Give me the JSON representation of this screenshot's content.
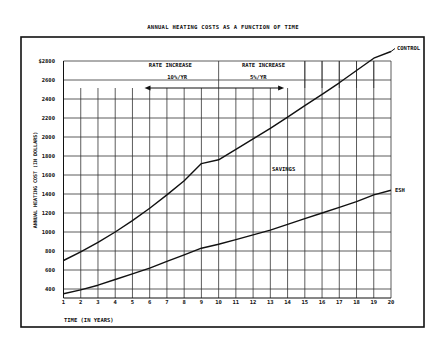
{
  "chart_data": {
    "type": "line",
    "title": "ANNUAL HEATING COSTS AS A FUNCTION OF TIME",
    "xlabel": "TIME (IN YEARS)",
    "ylabel": "ANNUAL HEATING COST (IN DOLLARS)",
    "x": [
      1,
      2,
      3,
      4,
      5,
      6,
      7,
      8,
      9,
      10,
      11,
      12,
      13,
      14,
      15,
      16,
      17,
      18,
      19,
      20
    ],
    "xlim": [
      1,
      20
    ],
    "ylim": [
      300,
      2800
    ],
    "x_ticks": [
      "1",
      "2",
      "3",
      "4",
      "5",
      "6",
      "7",
      "8",
      "9",
      "10",
      "11",
      "12",
      "13",
      "14",
      "15",
      "16",
      "17",
      "18",
      "19",
      "20"
    ],
    "y_ticks": [
      "$2800",
      "2600",
      "2400",
      "2200",
      "2000",
      "1800",
      "1600",
      "1400",
      "1200",
      "1000",
      "800",
      "600",
      "400"
    ],
    "grid": true,
    "series": [
      {
        "name": "CONTROL",
        "values": [
          700,
          790,
          890,
          1000,
          1120,
          1250,
          1390,
          1540,
          1720,
          1760,
          1870,
          1980,
          2090,
          2210,
          2330,
          2450,
          2570,
          2700,
          2830,
          2900
        ]
      },
      {
        "name": "ESH",
        "values": [
          350,
          390,
          440,
          500,
          560,
          620,
          690,
          760,
          830,
          870,
          920,
          970,
          1020,
          1080,
          1140,
          1200,
          1260,
          1320,
          1390,
          1440
        ]
      }
    ],
    "annotations": [
      {
        "text": "RATE INCREASE",
        "sub": "10%/YR",
        "range": [
          1,
          10
        ],
        "arrow": "left"
      },
      {
        "text": "RATE INCREASE",
        "sub": "5%/YR",
        "range": [
          10,
          15
        ],
        "arrow": "right"
      },
      {
        "text": "SAVINGS",
        "x": 14,
        "y": 1600
      },
      {
        "text": "CONTROL",
        "x": 20,
        "y": 2900
      },
      {
        "text": "ESH",
        "x": 20,
        "y": 1440
      }
    ]
  },
  "labels": {
    "title": "ANNUAL HEATING COSTS AS A FUNCTION OF TIME",
    "xlabel": "TIME (IN YEARS)",
    "ylabel": "ANNUAL HEATING COST (IN DOLLARS)",
    "rate1_title": "RATE INCREASE",
    "rate1_value": "10%/YR",
    "rate2_title": "RATE INCREASE",
    "rate2_value": "5%/YR",
    "savings": "SAVINGS",
    "control": "CONTROL",
    "esh": "ESH"
  }
}
